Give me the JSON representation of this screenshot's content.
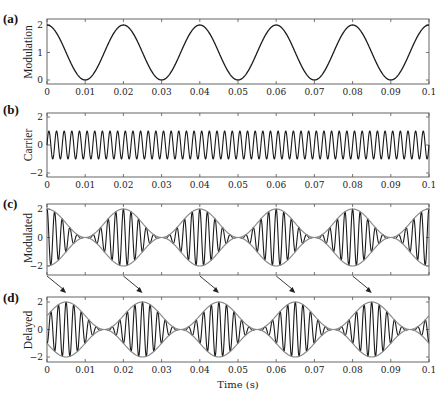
{
  "figure": {
    "x_axis_label": "Time (s)",
    "x_ticks": [
      "0",
      "0.01",
      "0.02",
      "0.03",
      "0.04",
      "0.05",
      "0.06",
      "0.07",
      "0.08",
      "0.09",
      "0.1"
    ],
    "colors": {
      "signal": "#1a1a1a",
      "envelope": "#8a8a8a",
      "axes": "#555555"
    }
  },
  "panels": [
    {
      "id": "a",
      "label": "(a)",
      "ylabel": "Modulation",
      "yticks": [
        "2",
        "1",
        "0"
      ],
      "show_xticklabels": true
    },
    {
      "id": "b",
      "label": "(b)",
      "ylabel": "Carrier",
      "yticks": [
        "2",
        "0",
        "−2"
      ],
      "show_xticklabels": true
    },
    {
      "id": "c",
      "label": "(c)",
      "ylabel": "Modulated",
      "yticks": [
        "2",
        "0",
        "−2"
      ],
      "show_xticklabels": false
    },
    {
      "id": "d",
      "label": "(d)",
      "ylabel": "Delayed",
      "yticks": [
        "2",
        "0",
        "−2"
      ],
      "show_xticklabels": true
    }
  ],
  "chart_data": [
    {
      "type": "line",
      "panel": "(a)",
      "title": "",
      "xlabel": "",
      "ylabel": "Modulation",
      "xlim": [
        0,
        0.1
      ],
      "ylim": [
        -0.1,
        2.1
      ],
      "yticks": [
        0,
        1,
        2
      ],
      "series": [
        {
          "name": "modulation",
          "formula": "1 + cos(2*pi*50*t)",
          "frequency_hz": 50,
          "offset": 1,
          "amplitude": 1,
          "x": [
            0,
            0.01,
            0.02,
            0.03,
            0.04,
            0.05,
            0.06,
            0.07,
            0.08,
            0.09,
            0.1
          ],
          "values": [
            2,
            0,
            2,
            0,
            2,
            0,
            2,
            0,
            2,
            0,
            2
          ]
        }
      ]
    },
    {
      "type": "line",
      "panel": "(b)",
      "ylabel": "Carrier",
      "xlim": [
        0,
        0.1
      ],
      "ylim": [
        -2.3,
        2.3
      ],
      "yticks": [
        -2,
        0,
        2
      ],
      "series": [
        {
          "name": "carrier",
          "formula": "sin(2*pi*500*t)",
          "frequency_hz": 500,
          "amplitude": 1
        }
      ]
    },
    {
      "type": "line",
      "panel": "(c)",
      "ylabel": "Modulated",
      "xlim": [
        0,
        0.1
      ],
      "ylim": [
        -2.3,
        2.3
      ],
      "yticks": [
        -2,
        0,
        2
      ],
      "series": [
        {
          "name": "modulated",
          "formula": "(1 + cos(2*pi*50*t)) * sin(2*pi*500*t)"
        },
        {
          "name": "envelope",
          "formula": "±(1 + cos(2*pi*50*t))",
          "color": "#8a8a8a"
        }
      ],
      "envelope_peaks_t": [
        0,
        0.02,
        0.04,
        0.06,
        0.08,
        0.1
      ]
    },
    {
      "type": "line",
      "panel": "(d)",
      "ylabel": "Delayed",
      "xlabel": "Time (s)",
      "xlim": [
        0,
        0.1
      ],
      "ylim": [
        -2.3,
        2.3
      ],
      "yticks": [
        -2,
        0,
        2
      ],
      "delay_s": 0.005,
      "series": [
        {
          "name": "delayed",
          "formula": "(1 + cos(2*pi*50*(t-0.005))) * sin(2*pi*500*(t-0.005))"
        },
        {
          "name": "envelope",
          "formula": "±(1 + cos(2*pi*50*(t-0.005)))",
          "color": "#8a8a8a"
        }
      ],
      "envelope_peaks_t": [
        0.005,
        0.025,
        0.045,
        0.065,
        0.085
      ],
      "annotations": [
        {
          "type": "arrow",
          "from_t": 0,
          "to_t": 0.005
        },
        {
          "type": "arrow",
          "from_t": 0.02,
          "to_t": 0.025
        },
        {
          "type": "arrow",
          "from_t": 0.04,
          "to_t": 0.045
        },
        {
          "type": "arrow",
          "from_t": 0.06,
          "to_t": 0.065
        },
        {
          "type": "arrow",
          "from_t": 0.08,
          "to_t": 0.085
        }
      ]
    }
  ]
}
